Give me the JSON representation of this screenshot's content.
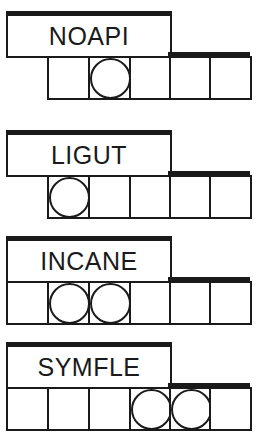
{
  "puzzles": [
    {
      "word": "NOAPI",
      "top": 11,
      "cells": [
        {
          "x": 47,
          "circled": false
        },
        {
          "x": 88,
          "circled": true
        },
        {
          "x": 129,
          "circled": false
        },
        {
          "x": 169,
          "circled": false
        },
        {
          "x": 209,
          "circled": false
        }
      ]
    },
    {
      "word": "LIGUT",
      "top": 130,
      "cells": [
        {
          "x": 47,
          "circled": true
        },
        {
          "x": 88,
          "circled": false
        },
        {
          "x": 129,
          "circled": false
        },
        {
          "x": 169,
          "circled": false
        },
        {
          "x": 209,
          "circled": false
        }
      ]
    },
    {
      "word": "INCANE",
      "top": 236,
      "cells": [
        {
          "x": 6,
          "circled": false
        },
        {
          "x": 47,
          "circled": true
        },
        {
          "x": 88,
          "circled": true
        },
        {
          "x": 129,
          "circled": false
        },
        {
          "x": 169,
          "circled": false
        },
        {
          "x": 209,
          "circled": false
        }
      ]
    },
    {
      "word": "SYMFLE",
      "top": 342,
      "cells": [
        {
          "x": 6,
          "circled": false
        },
        {
          "x": 47,
          "circled": false
        },
        {
          "x": 88,
          "circled": false
        },
        {
          "x": 129,
          "circled": true
        },
        {
          "x": 169,
          "circled": true
        },
        {
          "x": 209,
          "circled": false
        }
      ]
    }
  ]
}
